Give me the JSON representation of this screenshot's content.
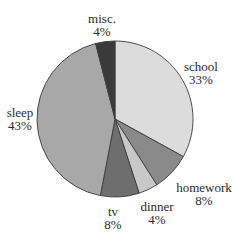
{
  "chart_data": {
    "type": "pie",
    "title": "",
    "start_angle_deg": 0,
    "direction": "clockwise",
    "center": [
      115,
      119
    ],
    "radius": 78,
    "slices": [
      {
        "label": "school",
        "value": 33,
        "value_label": "33%",
        "color": "#dcdcdc",
        "label_pos": [
          201,
          60
        ]
      },
      {
        "label": "homework",
        "value": 8,
        "value_label": "8%",
        "color": "#8a8a8a",
        "label_pos": [
          204,
          181
        ]
      },
      {
        "label": "dinner",
        "value": 4,
        "value_label": "4%",
        "color": "#c8c8c8",
        "label_pos": [
          157,
          200
        ]
      },
      {
        "label": "tv",
        "value": 8,
        "value_label": "8%",
        "color": "#6e6e6e",
        "label_pos": [
          113,
          205
        ]
      },
      {
        "label": "sleep",
        "value": 43,
        "value_label": "43%",
        "color": "#a8a8a8",
        "label_pos": [
          20,
          106
        ]
      },
      {
        "label": "misc.",
        "value": 4,
        "value_label": "4%",
        "color": "#3a3a3a",
        "label_pos": [
          102,
          12
        ]
      }
    ]
  }
}
